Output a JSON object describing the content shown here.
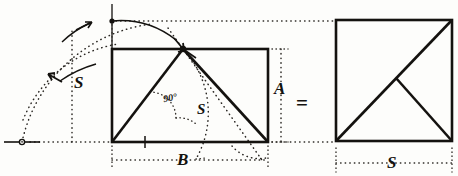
{
  "figure": {
    "ink_color": "#14120f",
    "paper_color": "#fdfdfb"
  },
  "labels": {
    "left_height_s": "S",
    "angle_right": "90°",
    "hypotenuse_s": "S",
    "base_b": "B",
    "right_side_a": "A",
    "equals": "=",
    "square_side_s": "S"
  },
  "shapes": {
    "rectangle": {
      "name": "left-rectangle",
      "x": 112,
      "y": 49,
      "width": 156,
      "height": 93,
      "base_label": "B",
      "side_label": "A"
    },
    "square": {
      "name": "right-square",
      "x": 336,
      "y": 20,
      "width": 116,
      "height": 121,
      "side_label": "S"
    },
    "apex_point": {
      "x": 183,
      "y": 49
    },
    "pivot_point": {
      "x": 22,
      "y": 142
    },
    "arc_top_point": {
      "x": 112,
      "y": 21
    }
  },
  "annotations": {
    "arc_arrow_left": "rotation-arrow-ccw",
    "arc_arrow_top": "rotation-arrow-cw",
    "tick_mark": "base-tick",
    "pivot_marker": "compass-pivot-circle"
  }
}
